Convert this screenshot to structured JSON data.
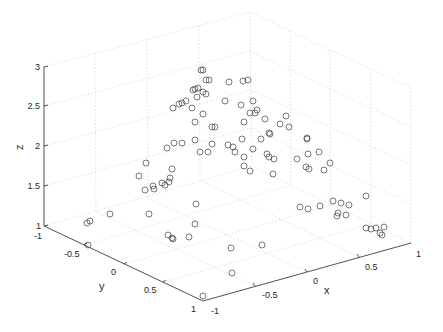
{
  "chart_data": {
    "type": "scatter3d",
    "title": "",
    "xlabel": "x",
    "ylabel": "y",
    "zlabel": "z",
    "xlim": [
      -1,
      1
    ],
    "ylim": [
      -1,
      1
    ],
    "zlim": [
      1,
      3
    ],
    "grid": true,
    "legend": null,
    "marker": "open-circle",
    "marker_color": "#404040",
    "x_ticks": [
      "-1",
      "-0.5",
      "0",
      "0.5",
      "1"
    ],
    "y_ticks": [
      "-1",
      "-0.5",
      "0",
      "0.5",
      "1"
    ],
    "z_ticks": [
      "1",
      "1.5",
      "2",
      "2.5",
      "3"
    ],
    "screen_points": [
      [
        206,
        80
      ],
      [
        209,
        80
      ],
      [
        229,
        82
      ],
      [
        243,
        81
      ],
      [
        248,
        80
      ],
      [
        201,
        70
      ],
      [
        203,
        70
      ],
      [
        193,
        90
      ],
      [
        195,
        89
      ],
      [
        198,
        88
      ],
      [
        203,
        92
      ],
      [
        206,
        94
      ],
      [
        197,
        97
      ],
      [
        186,
        101
      ],
      [
        182,
        103
      ],
      [
        179,
        104
      ],
      [
        173,
        108
      ],
      [
        192,
        108
      ],
      [
        225,
        101
      ],
      [
        241,
        105
      ],
      [
        253,
        101
      ],
      [
        257,
        110
      ],
      [
        250,
        113
      ],
      [
        255,
        113
      ],
      [
        203,
        114
      ],
      [
        195,
        122
      ],
      [
        244,
        122
      ],
      [
        212,
        127
      ],
      [
        215,
        127
      ],
      [
        265,
        119
      ],
      [
        286,
        116
      ],
      [
        280,
        124
      ],
      [
        289,
        127
      ],
      [
        269,
        133
      ],
      [
        270,
        134
      ],
      [
        261,
        139
      ],
      [
        253,
        149
      ],
      [
        267,
        154
      ],
      [
        269,
        157
      ],
      [
        274,
        159
      ],
      [
        307,
        138
      ],
      [
        307,
        139
      ],
      [
        308,
        154
      ],
      [
        319,
        152
      ],
      [
        297,
        159
      ],
      [
        306,
        167
      ],
      [
        309,
        169
      ],
      [
        330,
        163
      ],
      [
        324,
        170
      ],
      [
        244,
        157
      ],
      [
        244,
        166
      ],
      [
        250,
        171
      ],
      [
        273,
        174
      ],
      [
        87,
        223
      ],
      [
        90,
        221
      ],
      [
        110,
        214
      ],
      [
        88,
        245
      ],
      [
        145,
        190
      ],
      [
        154,
        189
      ],
      [
        165,
        185
      ],
      [
        162,
        183
      ],
      [
        169,
        182
      ],
      [
        170,
        178
      ],
      [
        172,
        169
      ],
      [
        153,
        186
      ],
      [
        139,
        176
      ],
      [
        146,
        163
      ],
      [
        167,
        148
      ],
      [
        174,
        143
      ],
      [
        182,
        143
      ],
      [
        195,
        140
      ],
      [
        200,
        152
      ],
      [
        212,
        144
      ],
      [
        228,
        145
      ],
      [
        233,
        147
      ],
      [
        235,
        152
      ],
      [
        242,
        139
      ],
      [
        208,
        152
      ],
      [
        300,
        207
      ],
      [
        308,
        209
      ],
      [
        320,
        206
      ],
      [
        333,
        201
      ],
      [
        341,
        203
      ],
      [
        349,
        205
      ],
      [
        366,
        196
      ],
      [
        338,
        213
      ],
      [
        337,
        216
      ],
      [
        346,
        215
      ],
      [
        366,
        228
      ],
      [
        371,
        229
      ],
      [
        376,
        228
      ],
      [
        384,
        227
      ],
      [
        380,
        233
      ],
      [
        382,
        235
      ],
      [
        149,
        214
      ],
      [
        196,
        204
      ],
      [
        195,
        224
      ],
      [
        168,
        235
      ],
      [
        172,
        238
      ],
      [
        173,
        239
      ],
      [
        189,
        237
      ],
      [
        231,
        248
      ],
      [
        262,
        245
      ],
      [
        232,
        273
      ],
      [
        203,
        296
      ]
    ]
  },
  "axes": {
    "z_ticks": [
      {
        "label": "3",
        "x": 36,
        "y": 70
      },
      {
        "label": "2.5",
        "x": 30,
        "y": 109
      },
      {
        "label": "2",
        "x": 36,
        "y": 149
      },
      {
        "label": "1.5",
        "x": 30,
        "y": 189
      },
      {
        "label": "1",
        "x": 37,
        "y": 229
      }
    ],
    "y_ticks": [
      {
        "label": "-1",
        "x": 36,
        "y": 239
      },
      {
        "label": "-0.5",
        "x": 65,
        "y": 257
      },
      {
        "label": "0",
        "x": 112,
        "y": 275
      },
      {
        "label": "0.5",
        "x": 145,
        "y": 293
      },
      {
        "label": "1",
        "x": 190,
        "y": 312
      }
    ],
    "x_ticks": [
      {
        "label": "-1",
        "x": 211,
        "y": 314
      },
      {
        "label": "-0.5",
        "x": 264,
        "y": 298
      },
      {
        "label": "0",
        "x": 314,
        "y": 284
      },
      {
        "label": "0.5",
        "x": 366,
        "y": 269
      },
      {
        "label": "1",
        "x": 416,
        "y": 256
      }
    ],
    "xlabel": {
      "text": "x",
      "x": 325,
      "y": 294
    },
    "ylabel": {
      "text": "y",
      "x": 100,
      "y": 290
    },
    "zlabel": {
      "text": "z",
      "x": 17,
      "y": 150
    }
  }
}
